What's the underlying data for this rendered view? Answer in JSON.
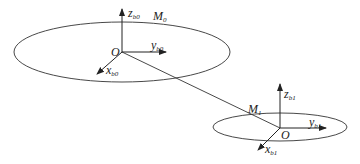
{
  "diagram": {
    "type": "coordinate-frames",
    "frames": [
      {
        "id": "b0",
        "origin_label": "O",
        "point_label": "M",
        "point_sub": "0",
        "axes": {
          "z": {
            "base": "z",
            "sub": "b0"
          },
          "y": {
            "base": "y",
            "sub": "b0"
          },
          "x": {
            "base": "x",
            "sub": "b0"
          }
        }
      },
      {
        "id": "b1",
        "origin_label": "O",
        "point_label": "M",
        "point_sub": "1",
        "axes": {
          "z": {
            "base": "z",
            "sub": "b1"
          },
          "y": {
            "base": "y",
            "sub": "b1"
          },
          "x": {
            "base": "x",
            "sub": "b1"
          }
        }
      }
    ],
    "connector": {
      "from": "O (b0)",
      "to": "O (b1)"
    },
    "colors": {
      "stroke": "#333333",
      "text": "#222222",
      "background": "#ffffff"
    }
  }
}
